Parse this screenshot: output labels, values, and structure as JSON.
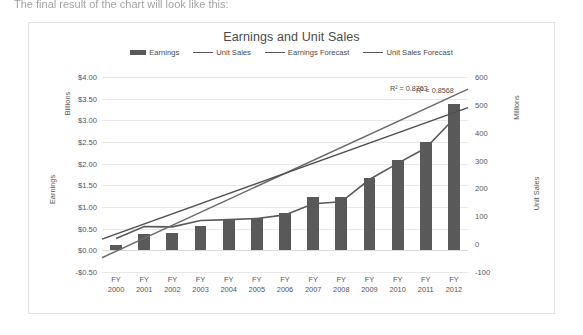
{
  "page": {
    "top_text": "The final result of the chart will look like this:"
  },
  "chart_data": {
    "type": "bar",
    "title": "Earnings and Unit Sales",
    "categories": [
      "FY 2000",
      "FY 2001",
      "FY 2002",
      "FY 2003",
      "FY 2004",
      "FY 2005",
      "FY 2006",
      "FY 2007",
      "FY 2008",
      "FY 2009",
      "FY 2010",
      "FY 2011",
      "FY 2012"
    ],
    "category_lines": [
      [
        "FY",
        "2000"
      ],
      [
        "FY",
        "2001"
      ],
      [
        "FY",
        "2002"
      ],
      [
        "FY",
        "2003"
      ],
      [
        "FY",
        "2004"
      ],
      [
        "FY",
        "2005"
      ],
      [
        "FY",
        "2006"
      ],
      [
        "FY",
        "2007"
      ],
      [
        "FY",
        "2008"
      ],
      [
        "FY",
        "2009"
      ],
      [
        "FY",
        "2010"
      ],
      [
        "FY",
        "2011"
      ],
      [
        "FY",
        "2012"
      ]
    ],
    "xlabel": "",
    "grid": true,
    "legend_position": "top",
    "series": [
      {
        "name": "Earnings",
        "type": "bar",
        "axis": "left",
        "color": "#595959",
        "values": [
          0.12,
          0.38,
          0.4,
          0.57,
          0.72,
          0.74,
          0.87,
          1.24,
          1.22,
          1.67,
          2.08,
          2.51,
          3.38
        ]
      },
      {
        "name": "Unit Sales",
        "type": "line",
        "axis": "right",
        "color": "#5a5a5a",
        "values": [
          20,
          63,
          62,
          85,
          88,
          92,
          105,
          145,
          152,
          232,
          290,
          345,
          450
        ]
      },
      {
        "name": "Earnings Forecast",
        "type": "trendline",
        "axis": "left",
        "color": "#6b6b6b",
        "endpoints": [
          -0.17,
          3.72
        ],
        "r2_label": "R² = 0.8763"
      },
      {
        "name": "Unit Sales Forecast",
        "type": "trendline",
        "axis": "right",
        "color": "#4f4f4f",
        "endpoints": [
          18,
          490
        ],
        "r2_label": "R² = 0.8568"
      }
    ],
    "left_axis": {
      "title": "Earnings",
      "unit_label": "Billions",
      "ylim": [
        -0.5,
        4.0
      ],
      "tick_step": 0.5,
      "ticks": [
        {
          "value": 4.0,
          "label": "$4.00"
        },
        {
          "value": 3.5,
          "label": "$3.50"
        },
        {
          "value": 3.0,
          "label": "$3.00"
        },
        {
          "value": 2.5,
          "label": "$2.50"
        },
        {
          "value": 2.0,
          "label": "$2.00"
        },
        {
          "value": 1.5,
          "label": "$1.50"
        },
        {
          "value": 1.0,
          "label": "$1.00"
        },
        {
          "value": 0.5,
          "label": "$0.50"
        },
        {
          "value": 0.0,
          "label": "$0.00"
        },
        {
          "value": -0.5,
          "label": "-$0.50"
        }
      ]
    },
    "right_axis": {
      "title": "Unit Sales",
      "unit_label": "Millions",
      "ylim": [
        -100,
        600
      ],
      "tick_step": 100,
      "ticks": [
        {
          "value": 600,
          "label": "600"
        },
        {
          "value": 500,
          "label": "500"
        },
        {
          "value": 400,
          "label": "400"
        },
        {
          "value": 300,
          "label": "300"
        },
        {
          "value": 200,
          "label": "200"
        },
        {
          "value": 100,
          "label": "100"
        },
        {
          "value": 0,
          "label": "0"
        },
        {
          "value": -100,
          "label": "-100"
        }
      ]
    },
    "annotations": [
      {
        "text": "R² = 0.8763",
        "series": "Earnings Forecast"
      },
      {
        "text": "R² = 0.8568",
        "series": "Unit Sales Forecast"
      }
    ]
  }
}
